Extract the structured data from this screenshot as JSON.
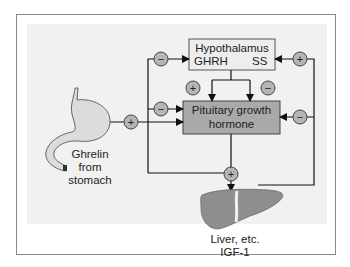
{
  "diagram": {
    "nodes": {
      "hypothalamus": {
        "title": "Hypothalamus",
        "left_label": "GHRH",
        "right_label": "SS"
      },
      "pituitary": {
        "line1": "Pituitary growth",
        "line2": "hormone"
      },
      "stomach": {
        "line1": "Ghrelin",
        "line2": "from",
        "line3": "stomach"
      },
      "liver": {
        "line1": "Liver, etc.",
        "line2": "IGF-1"
      }
    },
    "signs": {
      "plus": "+",
      "minus": "−"
    },
    "edges": [
      {
        "from": "stomach",
        "to": "pituitary",
        "sign": "+"
      },
      {
        "from": "stomach",
        "to": "liver",
        "sign": "+"
      },
      {
        "from": "pituitary",
        "to": "hypothalamus",
        "sign": "−"
      },
      {
        "from": "pituitary",
        "to": "pituitary",
        "sign": "−"
      },
      {
        "from": "hypothalamus.GHRH",
        "to": "pituitary",
        "sign": "+"
      },
      {
        "from": "hypothalamus.SS",
        "to": "pituitary",
        "sign": "−"
      },
      {
        "from": "pituitary",
        "to": "liver",
        "sign": "+"
      },
      {
        "from": "liver",
        "to": "hypothalamus.SS",
        "sign": "+"
      },
      {
        "from": "liver",
        "to": "pituitary",
        "sign": "−"
      }
    ],
    "colors": {
      "hypothalamus_fill": "#ededed",
      "pituitary_fill": "#a9a9a9",
      "sign_fill": "#b5b5b5",
      "liver_fill": "#8e8e8e",
      "stomach_fill": "#dcdcdc",
      "panel": "#f1f1f1"
    }
  }
}
